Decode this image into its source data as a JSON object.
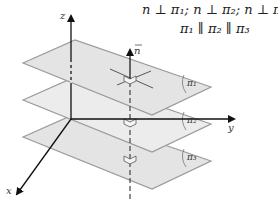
{
  "diagram": {
    "title_lines": [
      "n ⊥ π₁; n ⊥ π₂; n ⊥ π₃",
      "π₁ ∥ π₂ ∥ π₃"
    ],
    "axes": {
      "x": "x",
      "y": "y",
      "z": "z"
    },
    "normal_vector_label": "n",
    "planes": [
      {
        "label": "π₁",
        "offset_y": 0
      },
      {
        "label": "π₂",
        "offset_y": 37
      },
      {
        "label": "π₃",
        "offset_y": 74
      }
    ],
    "colors": {
      "plane_fill": "#e4e4e4",
      "plane_stroke": "#9a9a9a",
      "axis": "#111111"
    }
  }
}
